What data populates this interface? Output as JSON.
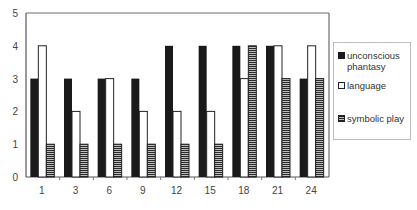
{
  "chart_data": {
    "type": "bar",
    "title": "",
    "xlabel": "",
    "ylabel": "",
    "ylim": [
      0,
      5
    ],
    "yticks": [
      "0",
      "1",
      "2",
      "3",
      "4",
      "5"
    ],
    "categories": [
      "1",
      "3",
      "6",
      "9",
      "12",
      "15",
      "18",
      "21",
      "24"
    ],
    "series": [
      {
        "name": "unconscious phantasy",
        "style": "solid-black",
        "color": "#1a1a1a",
        "values": [
          3,
          3,
          3,
          3,
          4,
          4,
          4,
          4,
          3
        ]
      },
      {
        "name": "language",
        "style": "white-outline",
        "color": "#ffffff",
        "values": [
          4,
          2,
          3,
          2,
          2,
          2,
          3,
          4,
          4
        ]
      },
      {
        "name": "symbolic play",
        "style": "horizontal-hatch",
        "color": "#aaaaaa",
        "values": [
          1,
          1,
          1,
          1,
          1,
          1,
          4,
          3,
          3
        ]
      }
    ],
    "grid": false,
    "legend_position": "right"
  },
  "legend": {
    "items": [
      {
        "label_line1": "unconscious",
        "label_line2": "phantasy"
      },
      {
        "label_line1": "language",
        "label_line2": ""
      },
      {
        "label_line1": "symbolic play",
        "label_line2": ""
      }
    ]
  }
}
